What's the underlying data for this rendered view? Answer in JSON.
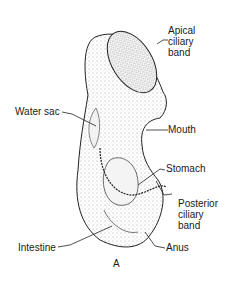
{
  "figure": {
    "caption": "A",
    "labels": {
      "apical_ciliary_band": [
        "Apical",
        "ciliary",
        "band"
      ],
      "water_sac": "Water sac",
      "mouth": "Mouth",
      "stomach": "Stomach",
      "posterior_ciliary_band": [
        "Posterior",
        "ciliary",
        "band"
      ],
      "intestine": "Intestine",
      "anus": "Anus"
    }
  }
}
